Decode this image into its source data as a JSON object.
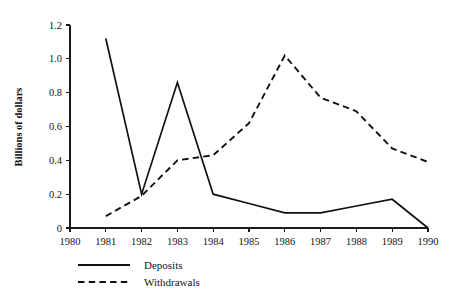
{
  "chart_data": {
    "type": "line",
    "title": "",
    "xlabel": "",
    "ylabel": "Billions of dollars",
    "x": [
      1980,
      1981,
      1982,
      1983,
      1984,
      1985,
      1986,
      1987,
      1988,
      1989,
      1990
    ],
    "categories": [
      "1980",
      "1981",
      "1982",
      "1983",
      "1984",
      "1985",
      "1986",
      "1987",
      "1988",
      "1989",
      "1990"
    ],
    "xlim": [
      1980,
      1990
    ],
    "ylim": [
      0,
      1.2
    ],
    "ytick_values": [
      0,
      0.2,
      0.4,
      0.6,
      0.8,
      1.0,
      1.2
    ],
    "ytick_labels": [
      "0",
      "0.2",
      "0.4",
      "0.6",
      "0.8",
      "1.0",
      "1.2"
    ],
    "xtick_labels": [
      "1980",
      "1981",
      "1982",
      "1983",
      "1984",
      "1985",
      "1986",
      "1987",
      "1988",
      "1989",
      "1990"
    ],
    "grid": false,
    "legend_position": "below-left",
    "series": [
      {
        "name": "Deposits",
        "style": "solid",
        "color": "#111111",
        "x": [
          1981,
          1982,
          1983,
          1984,
          1985,
          1986,
          1987,
          1988,
          1989,
          1990
        ],
        "values": [
          1.12,
          0.2,
          0.86,
          0.2,
          0.145,
          0.09,
          0.09,
          0.13,
          0.17,
          0.0
        ]
      },
      {
        "name": "Withdrawals",
        "style": "dashed",
        "color": "#111111",
        "x": [
          1981,
          1982,
          1983,
          1984,
          1985,
          1986,
          1987,
          1988,
          1989,
          1990
        ],
        "values": [
          0.07,
          0.19,
          0.4,
          0.43,
          0.62,
          1.02,
          0.77,
          0.69,
          0.47,
          0.39
        ]
      }
    ],
    "legend": [
      {
        "label": "Deposits",
        "style": "solid"
      },
      {
        "label": "Withdrawals",
        "style": "dashed"
      }
    ],
    "axis_color": "#1a1a1a"
  }
}
